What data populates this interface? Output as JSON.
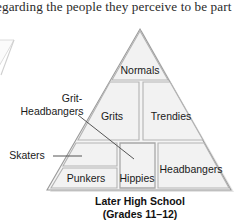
{
  "page": {
    "width": 236,
    "height": 224,
    "background": "#ffffff"
  },
  "body_text": {
    "cropped_line": "egarding the people they perceive to be part"
  },
  "figure": {
    "caption_line1": "Later High School",
    "caption_line2": "(Grades 11–12)",
    "colors": {
      "cell_fill": "#f2f2f2",
      "cell_stroke": "#b3b3b3",
      "outline": "#9a9a9a",
      "shadow": "#d9d9d9",
      "text": "#1a1a1a",
      "leader_line": "#555555"
    },
    "pyramid_cells": [
      {
        "id": "normals",
        "label": "Normals"
      },
      {
        "id": "grits",
        "label": "Grits"
      },
      {
        "id": "trendies",
        "label": "Trendies"
      },
      {
        "id": "skaters",
        "label": ""
      },
      {
        "id": "punkers",
        "label": "Punkers"
      },
      {
        "id": "hippies",
        "label": "Hippies"
      },
      {
        "id": "headbangers",
        "label": "Headbangers"
      }
    ],
    "callout_labels": [
      {
        "id": "grit-headbangers",
        "line1": "Grit-",
        "line2": "Headbangers"
      },
      {
        "id": "skaters",
        "line1": "Skaters",
        "line2": ""
      }
    ]
  }
}
